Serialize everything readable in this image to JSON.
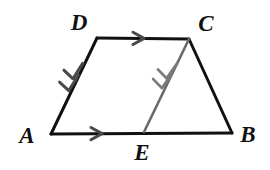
{
  "figure": {
    "width": 270,
    "height": 170,
    "background_color": "#ffffff",
    "stroke_color_primary": "#111111",
    "stroke_color_secondary": "#6a6a6a",
    "stroke_width_primary": 3,
    "stroke_width_secondary": 2.6
  },
  "points": {
    "A": {
      "label": "A",
      "x": 51,
      "y": 134,
      "label_x": 27,
      "label_y": 135
    },
    "B": {
      "label": "B",
      "x": 232,
      "y": 133,
      "label_x": 248,
      "label_y": 134
    },
    "C": {
      "label": "C",
      "x": 189,
      "y": 39,
      "label_x": 206,
      "label_y": 23
    },
    "D": {
      "label": "D",
      "x": 97,
      "y": 38,
      "label_x": 79,
      "label_y": 22
    },
    "E": {
      "label": "E",
      "x": 144,
      "y": 132,
      "label_x": 142,
      "label_y": 152
    }
  },
  "segments": [
    {
      "name": "segment-DC",
      "from": "D",
      "to": "C",
      "color": "#111111",
      "width": 3,
      "tick_marks": 1,
      "tick_direction": "toward-C",
      "description": "top side of trapezoid, single arrow mark"
    },
    {
      "name": "segment-AB",
      "from": "A",
      "to": "B",
      "color": "#111111",
      "width": 3,
      "tick_marks": 1,
      "tick_direction": "toward-B",
      "description": "base of trapezoid, single arrow mark on segment AE"
    },
    {
      "name": "segment-CB",
      "from": "C",
      "to": "B",
      "color": "#111111",
      "width": 3,
      "tick_marks": 0,
      "tick_direction": "none",
      "description": "right leg of trapezoid, unmarked"
    },
    {
      "name": "segment-DA",
      "from": "D",
      "to": "A",
      "color": "#111111",
      "width": 3,
      "tick_marks": 2,
      "tick_direction": "toward-A",
      "description": "left leg of trapezoid, double arrow marks"
    },
    {
      "name": "segment-CE",
      "from": "C",
      "to": "E",
      "color": "#6a6a6a",
      "width": 2.6,
      "tick_marks": 2,
      "tick_direction": "toward-E",
      "description": "interior transversal from C to E, double arrow marks, gray"
    }
  ],
  "marks": {
    "chevron_color_primary": "#4a4a4a",
    "chevron_color_secondary": "#7a7a7a",
    "chevron_half_length": 8,
    "chevron_half_width": 5.5
  }
}
